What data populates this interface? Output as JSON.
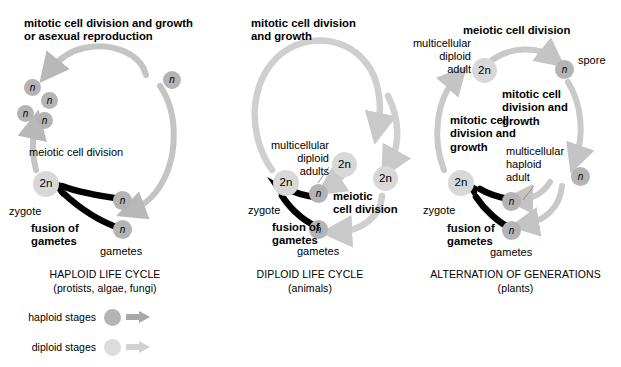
{
  "figure": {
    "colors": {
      "haploid": "#b4b4b4",
      "diploid": "#d8d8d8",
      "haploid_arrow": "#b4b4b4",
      "diploid_arrow": "#d8d8d8",
      "fusion_arrow": "#000000",
      "text": "#000000",
      "background": "#ffffff"
    }
  },
  "panels": [
    {
      "id": "haploid",
      "caption_title": "HAPLOID LIFE CYCLE",
      "caption_sub": "(protists, algae, fungi)",
      "labels": {
        "top": "mitotic cell division and growth\nor asexual reproduction",
        "meiosis": "meiotic cell division",
        "zygote": "zygote",
        "fusion": "fusion of\ngametes",
        "gametes": "gametes"
      },
      "cells": [
        {
          "name": "haploid-cell-cluster-1",
          "text": "n",
          "ploidy": "haploid"
        },
        {
          "name": "haploid-cell-cluster-2",
          "text": "n",
          "ploidy": "haploid"
        },
        {
          "name": "haploid-cell-cluster-3",
          "text": "n",
          "ploidy": "haploid"
        },
        {
          "name": "haploid-cell-cluster-4",
          "text": "n",
          "ploidy": "haploid"
        },
        {
          "name": "haploid-cell-top-right",
          "text": "n",
          "ploidy": "haploid"
        },
        {
          "name": "zygote-cell",
          "text": "2n",
          "ploidy": "diploid"
        },
        {
          "name": "gamete-cell-upper",
          "text": "n",
          "ploidy": "haploid"
        },
        {
          "name": "gamete-cell-lower",
          "text": "n",
          "ploidy": "haploid"
        }
      ]
    },
    {
      "id": "diploid",
      "caption_title": "DIPLOID LIFE CYCLE",
      "caption_sub": "(animals)",
      "labels": {
        "top": "mitotic cell division\nand growth",
        "adults": "multicellular\ndiploid\nadults",
        "meiosis": "meiotic\ncell division",
        "zygote": "zygote",
        "fusion": "fusion of\ngametes",
        "gametes": "gametes"
      },
      "cells": [
        {
          "name": "zygote-cell",
          "text": "2n",
          "ploidy": "diploid"
        },
        {
          "name": "adult-cell-inner",
          "text": "2n",
          "ploidy": "diploid"
        },
        {
          "name": "adult-cell-outer",
          "text": "2n",
          "ploidy": "diploid"
        },
        {
          "name": "meiosis-product-cell",
          "text": "n",
          "ploidy": "haploid"
        },
        {
          "name": "gamete-cell",
          "text": "n",
          "ploidy": "haploid"
        }
      ]
    },
    {
      "id": "alternation",
      "caption_title": "ALTERNATION OF GENERATIONS",
      "caption_sub": "(plants)",
      "labels": {
        "meiosis_top": "meiotic cell division",
        "diploid_adult": "multicellular\ndiploid\nadult",
        "spore": "spore",
        "mitosis_right": "mitotic cell\ndivision and\ngrowth",
        "mitosis_left": "mitotic cell\ndivision and\ngrowth",
        "haploid_adult": "multicellular\nhaploid\nadult",
        "zygote": "zygote",
        "fusion": "fusion of\ngametes",
        "gametes": "gametes"
      },
      "cells": [
        {
          "name": "diploid-adult-cell",
          "text": "2n",
          "ploidy": "diploid"
        },
        {
          "name": "spore-cell",
          "text": "n",
          "ploidy": "haploid"
        },
        {
          "name": "haploid-adult-cell",
          "text": "n",
          "ploidy": "haploid"
        },
        {
          "name": "zygote-cell",
          "text": "2n",
          "ploidy": "diploid"
        },
        {
          "name": "gamete-cell-upper",
          "text": "n",
          "ploidy": "haploid"
        },
        {
          "name": "gamete-cell-lower",
          "text": "n",
          "ploidy": "haploid"
        }
      ]
    }
  ],
  "legend": {
    "rows": [
      {
        "label": "haploid stages",
        "ploidy": "haploid"
      },
      {
        "label": "diploid stages",
        "ploidy": "diploid"
      }
    ]
  }
}
